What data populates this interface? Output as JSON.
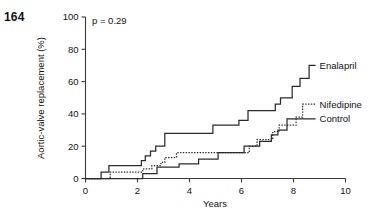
{
  "page_number": "164",
  "chart_data": {
    "type": "line",
    "title": "",
    "subtitle": "",
    "xlabel": "Years",
    "ylabel": "Aortic-valve replacement (%)",
    "xlim": [
      0,
      10
    ],
    "ylim": [
      0,
      100
    ],
    "xticks": [
      0,
      2,
      4,
      6,
      8,
      10
    ],
    "xticklabels": [
      "0",
      "2",
      "4",
      "6",
      "8",
      "10"
    ],
    "yticks": [
      0,
      20,
      40,
      60,
      80,
      100
    ],
    "yticklabels": [
      "0",
      "20",
      "40",
      "60",
      "80",
      "100"
    ],
    "grid": false,
    "legend_position": "right-inline",
    "annotations": [
      {
        "name": "p-value",
        "text": "p = 0.29",
        "x": 0.25,
        "y": 97
      }
    ],
    "series": [
      {
        "name": "Enalapril",
        "label": "Enalapril",
        "style": "solid",
        "color": "#2b2b2b",
        "label_x": 8.85,
        "label_y": 70,
        "points": [
          [
            0.0,
            0
          ],
          [
            0.6,
            0
          ],
          [
            0.6,
            4
          ],
          [
            0.9,
            4
          ],
          [
            0.9,
            8
          ],
          [
            2.15,
            8
          ],
          [
            2.15,
            11
          ],
          [
            2.3,
            11
          ],
          [
            2.3,
            14
          ],
          [
            2.5,
            14
          ],
          [
            2.5,
            17
          ],
          [
            2.7,
            17
          ],
          [
            2.7,
            20
          ],
          [
            3.05,
            20
          ],
          [
            3.05,
            28
          ],
          [
            4.9,
            28
          ],
          [
            4.9,
            33
          ],
          [
            5.9,
            33
          ],
          [
            5.9,
            36
          ],
          [
            6.25,
            36
          ],
          [
            6.25,
            42
          ],
          [
            7.3,
            42
          ],
          [
            7.3,
            46
          ],
          [
            7.5,
            46
          ],
          [
            7.5,
            50
          ],
          [
            7.95,
            50
          ],
          [
            7.95,
            57
          ],
          [
            8.25,
            57
          ],
          [
            8.25,
            62
          ],
          [
            8.6,
            62
          ],
          [
            8.6,
            70
          ],
          [
            8.85,
            70
          ]
        ]
      },
      {
        "name": "Nifedipine",
        "label": "Nifedipine",
        "style": "dotted",
        "color": "#2b2b2b",
        "label_x": 8.85,
        "label_y": 46,
        "points": [
          [
            0.0,
            0
          ],
          [
            0.95,
            0
          ],
          [
            0.95,
            4
          ],
          [
            2.2,
            4
          ],
          [
            2.2,
            6
          ],
          [
            2.55,
            6
          ],
          [
            2.55,
            8
          ],
          [
            2.9,
            8
          ],
          [
            2.9,
            10
          ],
          [
            3.05,
            10
          ],
          [
            3.05,
            13
          ],
          [
            3.5,
            13
          ],
          [
            3.5,
            16
          ],
          [
            6.3,
            16
          ],
          [
            6.3,
            20
          ],
          [
            6.6,
            20
          ],
          [
            6.6,
            24
          ],
          [
            7.2,
            24
          ],
          [
            7.2,
            29
          ],
          [
            7.45,
            29
          ],
          [
            7.45,
            33
          ],
          [
            8.1,
            33
          ],
          [
            8.1,
            38
          ],
          [
            8.35,
            38
          ],
          [
            8.35,
            46
          ],
          [
            8.85,
            46
          ]
        ]
      },
      {
        "name": "Control",
        "label": "Control",
        "style": "solid",
        "color": "#2b2b2b",
        "label_x": 8.85,
        "label_y": 37,
        "points": [
          [
            0.0,
            0
          ],
          [
            2.2,
            0
          ],
          [
            2.2,
            3
          ],
          [
            2.75,
            3
          ],
          [
            2.75,
            7
          ],
          [
            3.6,
            7
          ],
          [
            3.6,
            9
          ],
          [
            4.35,
            9
          ],
          [
            4.35,
            12
          ],
          [
            5.1,
            12
          ],
          [
            5.1,
            16
          ],
          [
            6.1,
            16
          ],
          [
            6.1,
            20
          ],
          [
            6.7,
            20
          ],
          [
            6.7,
            23
          ],
          [
            7.15,
            23
          ],
          [
            7.15,
            27
          ],
          [
            7.4,
            27
          ],
          [
            7.4,
            30
          ],
          [
            7.75,
            30
          ],
          [
            7.75,
            37
          ],
          [
            8.85,
            37
          ]
        ]
      }
    ]
  }
}
